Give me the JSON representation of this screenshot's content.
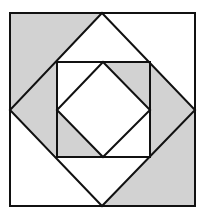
{
  "diagram": {
    "type": "geometric-quilt-pattern",
    "colors": {
      "background": "#ffffff",
      "shade": "#d2d2d2",
      "stroke": "#111111"
    },
    "stroke_width": 2,
    "outer_square": {
      "x": 10,
      "y": 13,
      "width": 185,
      "height": 193
    },
    "large_diamond": {
      "points": "102,13 195,110 102,206 10,110"
    },
    "inner_square": {
      "x": 57,
      "y": 62,
      "width": 93,
      "height": 95
    },
    "inner_diamond": {
      "points": "103,62 150,110 103,157 57,110"
    },
    "shaded_regions": [
      {
        "name": "outer-top-left-triangle",
        "points": "10,13 102,13 10,110"
      },
      {
        "name": "outer-bottom-right-triangle",
        "points": "195,110 195,206 102,206"
      },
      {
        "name": "left-band-triangle",
        "points": "10,110 57,62 57,157"
      },
      {
        "name": "right-band-triangle",
        "points": "150,62 195,110 150,157"
      },
      {
        "name": "inner-top-right-triangle",
        "points": "103,62 150,62 150,110"
      },
      {
        "name": "inner-bottom-left-triangle",
        "points": "57,110 57,157 103,157"
      }
    ]
  }
}
